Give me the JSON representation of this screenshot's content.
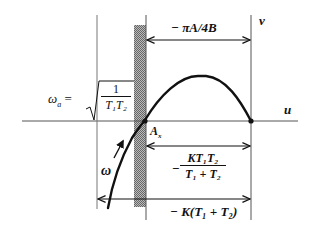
{
  "diagram": {
    "type": "nyquist-plot-sketch",
    "axes": {
      "horizontal_label": "u",
      "vertical_label": "v"
    },
    "labels": {
      "omega_a_lhs": "ω",
      "omega_a_sub": "a",
      "omega_a_eq": "=",
      "omega_a_num": "1",
      "omega_a_den": "T₁T₂",
      "point_A": "A",
      "point_A_sub": "x",
      "omega": "ω",
      "top_dim": "− πA/4B",
      "mid_dim_sign": "−",
      "mid_dim_num": "KT₁T₂",
      "mid_dim_den": "T₁ + T₂",
      "bottom_dim": "− K(T₁ + T₂)"
    },
    "colors": {
      "line": "#111111",
      "axis": "#555555",
      "hatch": "#888888"
    }
  }
}
